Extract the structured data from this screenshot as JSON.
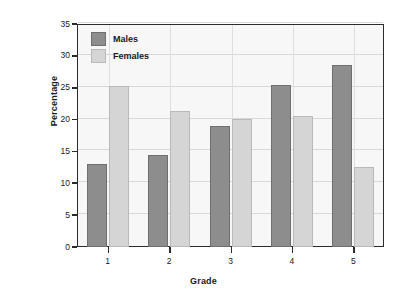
{
  "chart_data": {
    "type": "bar",
    "title": "",
    "xlabel": "Grade",
    "ylabel": "Percentage",
    "categories": [
      "1",
      "2",
      "3",
      "4",
      "5"
    ],
    "series": [
      {
        "name": "Males",
        "color": "#8d8d8d",
        "values": [
          13.1,
          14.5,
          19.0,
          25.5,
          28.5
        ]
      },
      {
        "name": "Females",
        "color": "#d5d5d5",
        "values": [
          25.3,
          21.3,
          20.1,
          20.6,
          12.5
        ]
      }
    ],
    "ylim": [
      0,
      35
    ],
    "yticks": [
      0,
      5,
      10,
      15,
      20,
      25,
      30,
      35
    ],
    "ytick_labels": [
      "0",
      "5",
      "10",
      "15",
      "20",
      "25",
      "30",
      "35"
    ],
    "grid": true,
    "legend_position": "top-left"
  }
}
